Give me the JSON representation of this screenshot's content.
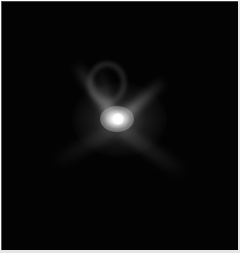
{
  "image": {
    "description": "Grayscale astronomical image of a bright central point source with diffuse ejecta streaks forming a V/butterfly shape on a black background",
    "colors": {
      "background": "#030303",
      "core": "#ffffff",
      "ejecta": "#9a9a9a"
    },
    "features": [
      "bright-core",
      "ejecta-streak-upper-left",
      "ejecta-streak-upper-right",
      "ejecta-loop",
      "diffuse-halo",
      "faint-streak-lower-right",
      "faint-streak-lower-left"
    ]
  }
}
